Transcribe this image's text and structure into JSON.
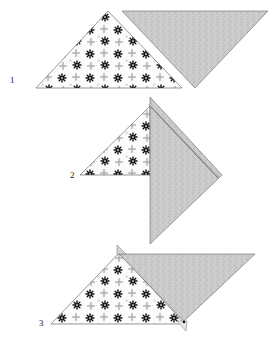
{
  "diagram": {
    "colors": {
      "background": "#ffffff",
      "outline": "#555555",
      "gray_fabric": "#c9c9c9",
      "gray_fabric_dark": "#b5b5b5",
      "print_fabric": "#fbfbfb",
      "flower_dark": "#111111",
      "flower_light": "#9a9a9a"
    },
    "steps": [
      {
        "label": "1",
        "description": "Print triangle and gray triangle placed side by side"
      },
      {
        "label": "2",
        "description": "Gray triangle laid over print triangle, seam line along diagonal"
      },
      {
        "label": "3",
        "description": "Triangles offset with dog-ear points extending past edges"
      }
    ]
  }
}
